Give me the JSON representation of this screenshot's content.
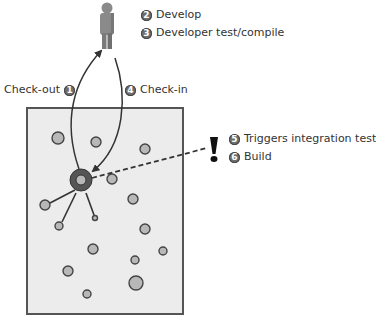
{
  "diagram": {
    "type": "continuous-integration-workflow",
    "colors": {
      "box_fill": "#ececec",
      "box_stroke": "#555555",
      "node_fill": "#b8b8b8",
      "node_stroke": "#444444",
      "hub_outer": "#555555",
      "hub_inner": "#b8b8b8",
      "person": "#8a8a8a",
      "line": "#333333"
    },
    "steps": [
      {
        "number": "1",
        "label": "Check-out"
      },
      {
        "number": "2",
        "label": "Develop"
      },
      {
        "number": "3",
        "label": "Developer test/compile"
      },
      {
        "number": "4",
        "label": "Check-in"
      },
      {
        "number": "5",
        "label": "Triggers integration test"
      },
      {
        "number": "6",
        "label": "Build"
      }
    ],
    "repository_box": {
      "x": 27,
      "y": 108,
      "width": 156,
      "height": 206
    },
    "hub": {
      "cx": 81,
      "cy": 180,
      "r_outer": 11,
      "r_inner": 5
    },
    "nodes": [
      {
        "cx": 58,
        "cy": 138,
        "r": 6
      },
      {
        "cx": 96,
        "cy": 142,
        "r": 5
      },
      {
        "cx": 145,
        "cy": 149,
        "r": 5
      },
      {
        "cx": 112,
        "cy": 179,
        "r": 5
      },
      {
        "cx": 45,
        "cy": 205,
        "r": 5
      },
      {
        "cx": 133,
        "cy": 199,
        "r": 5
      },
      {
        "cx": 59,
        "cy": 226,
        "r": 4
      },
      {
        "cx": 95,
        "cy": 218,
        "r": 2.5
      },
      {
        "cx": 145,
        "cy": 229,
        "r": 5
      },
      {
        "cx": 93,
        "cy": 249,
        "r": 5
      },
      {
        "cx": 163,
        "cy": 251,
        "r": 4
      },
      {
        "cx": 135,
        "cy": 260,
        "r": 4
      },
      {
        "cx": 68,
        "cy": 271,
        "r": 5
      },
      {
        "cx": 136,
        "cy": 283,
        "r": 7
      },
      {
        "cx": 87,
        "cy": 294,
        "r": 4
      }
    ],
    "spokes": [
      {
        "x1": 75,
        "y1": 190,
        "x2": 50,
        "y2": 203
      },
      {
        "x1": 76,
        "y1": 193,
        "x2": 62,
        "y2": 222
      },
      {
        "x1": 86,
        "y1": 193,
        "x2": 94,
        "y2": 215
      }
    ]
  }
}
